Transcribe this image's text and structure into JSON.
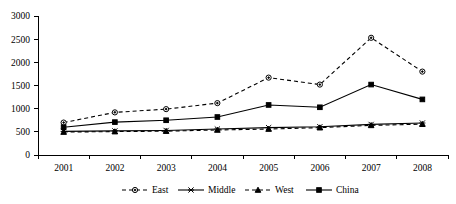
{
  "chart_data": {
    "type": "line",
    "title": "",
    "subtitle": "",
    "xlabel": "",
    "ylabel": "",
    "categories": [
      "2001",
      "2002",
      "2003",
      "2004",
      "2005",
      "2006",
      "2007",
      "2008"
    ],
    "x": [
      2001,
      2002,
      2003,
      2004,
      2005,
      2006,
      2007,
      2008
    ],
    "ylim": [
      0,
      3000
    ],
    "yticks": [
      0,
      500,
      1000,
      1500,
      2000,
      2500,
      3000
    ],
    "ytick_labels": [
      "0",
      "500",
      "1000",
      "1500",
      "2000",
      "2500",
      "3000"
    ],
    "grid": false,
    "legend_position": "bottom",
    "series": [
      {
        "name": "East",
        "line_style": "dashed",
        "marker": "circle-hollow",
        "color": "#000000",
        "values": [
          700,
          920,
          990,
          1120,
          1670,
          1520,
          2530,
          1800
        ]
      },
      {
        "name": "Middle",
        "line_style": "solid",
        "marker": "cross",
        "color": "#000000",
        "values": [
          510,
          520,
          530,
          560,
          590,
          610,
          660,
          690
        ]
      },
      {
        "name": "West",
        "line_style": "dashed",
        "marker": "triangle",
        "color": "#000000",
        "values": [
          495,
          505,
          515,
          540,
          560,
          590,
          640,
          665
        ]
      },
      {
        "name": "China",
        "line_style": "solid",
        "marker": "square-solid",
        "color": "#000000",
        "values": [
          600,
          710,
          750,
          820,
          1080,
          1030,
          1520,
          1200
        ]
      }
    ]
  },
  "legend": {
    "items": [
      {
        "label": "East"
      },
      {
        "label": "Middle"
      },
      {
        "label": "West"
      },
      {
        "label": "China"
      }
    ]
  }
}
